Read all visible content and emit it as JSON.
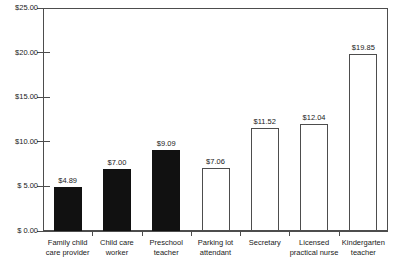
{
  "top_caption": "",
  "chart_data": {
    "type": "bar",
    "title": "",
    "xlabel": "",
    "ylabel": "",
    "ylim": [
      0,
      25
    ],
    "grid": false,
    "legend": null,
    "y_ticks": [
      {
        "value": 25,
        "label": "$25.00"
      },
      {
        "value": 20,
        "label": "$20.00"
      },
      {
        "value": 15,
        "label": "$15.00"
      },
      {
        "value": 10,
        "label": "$10.00"
      },
      {
        "value": 5,
        "label": "$ 5.00"
      },
      {
        "value": 0,
        "label": "$ 0.00"
      }
    ],
    "categories": [
      "Family child care provider",
      "Child care worker",
      "Preschool teacher",
      "Parking lot attendant",
      "Secretary",
      "Licensed practical nurse",
      "Kindergarten teacher"
    ],
    "category_lines": [
      [
        "Family child",
        "care provider"
      ],
      [
        "Child care",
        "worker"
      ],
      [
        "Preschool",
        "teacher"
      ],
      [
        "Parking lot",
        "attendant"
      ],
      [
        "Secretary"
      ],
      [
        "Licensed",
        "practical nurse"
      ],
      [
        "Kindergarten",
        "teacher"
      ]
    ],
    "values": [
      4.89,
      7.0,
      9.09,
      7.06,
      11.52,
      12.04,
      19.85
    ],
    "value_labels": [
      "$4.89",
      "$7.00",
      "$9.09",
      "$7.06",
      "$11.52",
      "$12.04",
      "$19.85"
    ],
    "bar_styles": [
      "filled",
      "filled",
      "filled",
      "hollow",
      "hollow",
      "hollow",
      "hollow"
    ],
    "colors": {
      "filled": "#111111",
      "hollow": "#ffffff",
      "outline": "#4d4d4d",
      "text": "#1a1a1a"
    }
  }
}
